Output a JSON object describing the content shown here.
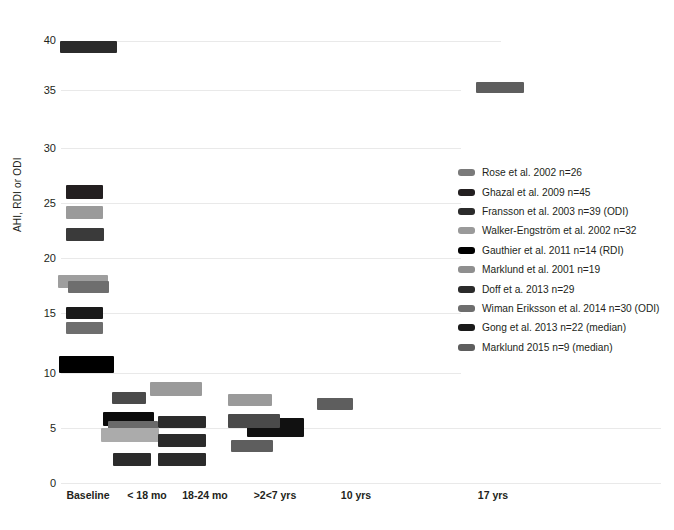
{
  "chart_data": {
    "type": "bar",
    "title": "",
    "xlabel": "",
    "ylabel": "AHI, RDI or ODI",
    "ylim": [
      0,
      41
    ],
    "yticks": [
      0,
      5,
      10,
      15,
      20,
      25,
      30,
      35,
      40
    ],
    "grid": true,
    "legend_position": "right",
    "categories": [
      "Baseline",
      "< 18 mo",
      "18-24 mo",
      ">2<7 yrs",
      "10 yrs",
      "17 yrs"
    ],
    "series": [
      {
        "name": "Rose et al. 2002 n=26",
        "color": "#7a7a7a",
        "points": [
          {
            "category": "Baseline",
            "value": 18.3
          },
          {
            "category": "< 18 mo",
            "value": 4.6
          }
        ]
      },
      {
        "name": "Ghazal et al. 2009 n=45",
        "color": "#231f20",
        "points": [
          {
            "category": "Baseline",
            "value": 26.0
          },
          {
            "category": "< 18 mo",
            "value": 6.0
          }
        ]
      },
      {
        "name": "Fransson et al. 2003 n=39 (ODI)",
        "color": "#3a3a3a",
        "points": [
          {
            "category": "Baseline",
            "value": 22.7
          },
          {
            "category": "< 18 mo",
            "value": 3.0
          },
          {
            "category": "18-24 mo",
            "value": 3.2
          }
        ]
      },
      {
        "name": "Walker-Engström et al. 2002 n=32",
        "color": "#9a9a9a",
        "points": [
          {
            "category": "Baseline",
            "value": 24.1
          },
          {
            "category": "18-24 mo",
            "value": 8.6
          },
          {
            "category": ">2<7 yrs",
            "value": 7.1
          }
        ]
      },
      {
        "name": "Gauthier et al. 2011 n=14 (RDI)",
        "color": "#000000",
        "points": [
          {
            "category": "Baseline",
            "value": 10.7
          },
          {
            "category": "< 18 mo",
            "value": 5.5
          },
          {
            "category": ">2<7 yrs",
            "value": 4.7
          }
        ]
      },
      {
        "name": "Marklund et al. 2001 n=19",
        "color": "#8f8f8f",
        "points": [
          {
            "category": "Baseline",
            "value": 17.8
          },
          {
            "category": "< 18 mo",
            "value": 4.5
          }
        ]
      },
      {
        "name": "Doff et a. 2013 n=29",
        "color": "#2b2b2b",
        "points": [
          {
            "category": "Baseline",
            "value": 39.0
          },
          {
            "category": "18-24 mo",
            "value": 5.9
          },
          {
            "category": ">2<7 yrs",
            "value": 4.5
          }
        ]
      },
      {
        "name": "Wiman Eriksson et al. 2014 n=30 (ODI)",
        "color": "#6e6e6e",
        "points": [
          {
            "category": "Baseline",
            "value": 15.0
          },
          {
            "category": "< 18 mo",
            "value": 5.9
          },
          {
            "category": "18-24 mo",
            "value": 4.3
          },
          {
            "category": ">2<7 yrs",
            "value": 3.4
          }
        ]
      },
      {
        "name": "Gong et al. 2013 n=22 (median)",
        "color": "#1a1a1a",
        "points": [
          {
            "category": "Baseline",
            "value": 15.5
          },
          {
            "category": "< 18 mo",
            "value": 3.1
          }
        ]
      },
      {
        "name": "Marklund 2015 n=9 (median)",
        "color": "#5e5e5e",
        "points": [
          {
            "category": "10 yrs",
            "value": 6.9
          },
          {
            "category": "17 yrs",
            "value": 35.3
          }
        ]
      }
    ]
  },
  "axes": {
    "y_title": "AHI, RDI or ODI",
    "y_ticks": [
      "40",
      "35",
      "30",
      "25",
      "20",
      "15",
      "10",
      "5",
      "0"
    ],
    "x_ticks": [
      "Baseline",
      "< 18 mo",
      "18-24 mo",
      ">2<7 yrs",
      "10 yrs",
      "17 yrs"
    ]
  },
  "legend": {
    "items": [
      {
        "label": "Rose et al. 2002 n=26",
        "color": "#7a7a7a"
      },
      {
        "label": "Ghazal et al. 2009 n=45",
        "color": "#231f20"
      },
      {
        "label": "Fransson et al. 2003 n=39 (ODI)",
        "color": "#2b2b2b"
      },
      {
        "label": "Walker-Engström et al. 2002 n=32",
        "color": "#9a9a9a"
      },
      {
        "label": "Gauthier et al. 2011 n=14 (RDI)",
        "color": "#000000"
      },
      {
        "label": "Marklund et al. 2001 n=19",
        "color": "#8f8f8f"
      },
      {
        "label": "Doff et a. 2013 n=29",
        "color": "#2b2b2b"
      },
      {
        "label": "Wiman Eriksson et al. 2014 n=30 (ODI)",
        "color": "#6e6e6e"
      },
      {
        "label": "Gong et al. 2013 n=22 (median)",
        "color": "#1a1a1a"
      },
      {
        "label": "Marklund 2015 n=9 (median)",
        "color": "#5e5e5e"
      }
    ]
  },
  "bars": [
    {
      "name": "doff-baseline",
      "x": 60,
      "y": 41,
      "w": 57,
      "h": 12,
      "color": "#2b2b2b"
    },
    {
      "name": "marklund2015-17yrs",
      "x": 476,
      "y": 82,
      "w": 48,
      "h": 11,
      "color": "#5e5e5e"
    },
    {
      "name": "ghazal-baseline",
      "x": 66,
      "y": 185,
      "w": 37,
      "h": 14,
      "color": "#231f20"
    },
    {
      "name": "walker-baseline",
      "x": 66,
      "y": 206,
      "w": 37,
      "h": 13,
      "color": "#9a9a9a"
    },
    {
      "name": "fransson-baseline",
      "x": 66,
      "y": 228,
      "w": 38,
      "h": 13,
      "color": "#3a3a3a"
    },
    {
      "name": "marklund2001-baseline",
      "x": 58,
      "y": 275,
      "w": 50,
      "h": 13,
      "color": "#9e9e9e"
    },
    {
      "name": "rose-baseline",
      "x": 68,
      "y": 281,
      "w": 41,
      "h": 12,
      "color": "#6e6e6e"
    },
    {
      "name": "gong-baseline",
      "x": 66,
      "y": 307,
      "w": 37,
      "h": 12,
      "color": "#1a1a1a"
    },
    {
      "name": "wiman-baseline",
      "x": 66,
      "y": 322,
      "w": 37,
      "h": 12,
      "color": "#6e6e6e"
    },
    {
      "name": "gauthier-baseline",
      "x": 59,
      "y": 356,
      "w": 55,
      "h": 17,
      "color": "#000000"
    },
    {
      "name": "walker-18to24mo",
      "x": 150,
      "y": 382,
      "w": 52,
      "h": 14,
      "color": "#9a9a9a"
    },
    {
      "name": "walker-gt2lt7yrs",
      "x": 228,
      "y": 394,
      "w": 44,
      "h": 12,
      "color": "#9a9a9a"
    },
    {
      "name": "fransson-18to24mo-hi",
      "x": 112,
      "y": 392,
      "w": 34,
      "h": 12,
      "color": "#4a4a4a"
    },
    {
      "name": "marklund2015-10yrs",
      "x": 317,
      "y": 398,
      "w": 36,
      "h": 12,
      "color": "#5e5e5e"
    },
    {
      "name": "ghazal-lt18mo",
      "x": 103,
      "y": 412,
      "w": 51,
      "h": 14,
      "color": "#0b0b0b"
    },
    {
      "name": "wiman-lt18mo",
      "x": 158,
      "y": 416,
      "w": 48,
      "h": 12,
      "color": "#2b2b2b"
    },
    {
      "name": "gauthier-lt18mo",
      "x": 108,
      "y": 421,
      "w": 50,
      "h": 12,
      "color": "#6a6a6a"
    },
    {
      "name": "doff-gt2lt7yrs-dark",
      "x": 247,
      "y": 418,
      "w": 57,
      "h": 19,
      "color": "#111111"
    },
    {
      "name": "gauthier-gt2lt7yrs",
      "x": 228,
      "y": 414,
      "w": 52,
      "h": 14,
      "color": "#4a4a4a"
    },
    {
      "name": "marklund2001-lt18mo",
      "x": 101,
      "y": 428,
      "w": 58,
      "h": 14,
      "color": "#ababab"
    },
    {
      "name": "doff-18to24mo",
      "x": 158,
      "y": 434,
      "w": 48,
      "h": 13,
      "color": "#2b2b2b"
    },
    {
      "name": "wiman-gt2lt7yrs",
      "x": 231,
      "y": 440,
      "w": 42,
      "h": 12,
      "color": "#5e5e5e"
    },
    {
      "name": "gong-lt18mo",
      "x": 113,
      "y": 453,
      "w": 38,
      "h": 13,
      "color": "#2b2b2b"
    },
    {
      "name": "fransson-18to24mo",
      "x": 158,
      "y": 453,
      "w": 48,
      "h": 13,
      "color": "#2b2b2b"
    }
  ],
  "gridlines": [
    {
      "name": "gridline-40",
      "y": 41,
      "w": 440
    },
    {
      "name": "gridline-35",
      "y": 90,
      "w": 400
    },
    {
      "name": "gridline-30",
      "y": 148,
      "w": 400
    },
    {
      "name": "gridline-25",
      "y": 203,
      "w": 400
    },
    {
      "name": "gridline-20",
      "y": 258,
      "w": 400
    },
    {
      "name": "gridline-15",
      "y": 313,
      "w": 400
    },
    {
      "name": "gridline-10",
      "y": 373,
      "w": 400
    },
    {
      "name": "gridline-5",
      "y": 428,
      "w": 600
    },
    {
      "name": "gridline-0",
      "y": 483,
      "w": 600
    }
  ],
  "y_tick_positions": [
    {
      "label": "40",
      "y": 35
    },
    {
      "label": "35",
      "y": 85
    },
    {
      "label": "30",
      "y": 143
    },
    {
      "label": "25",
      "y": 198
    },
    {
      "label": "20",
      "y": 253
    },
    {
      "label": "15",
      "y": 308
    },
    {
      "label": "10",
      "y": 368
    },
    {
      "label": "5",
      "y": 423
    },
    {
      "label": "0",
      "y": 478
    }
  ],
  "x_tick_positions": [
    {
      "label": "Baseline",
      "x": 56,
      "w": 64
    },
    {
      "label": "< 18 mo",
      "x": 118,
      "w": 58
    },
    {
      "label": "18-24 mo",
      "x": 173,
      "w": 64
    },
    {
      "label": ">2<7 yrs",
      "x": 244,
      "w": 62
    },
    {
      "label": "10 yrs",
      "x": 331,
      "w": 50
    },
    {
      "label": "17 yrs",
      "x": 468,
      "w": 50
    }
  ]
}
